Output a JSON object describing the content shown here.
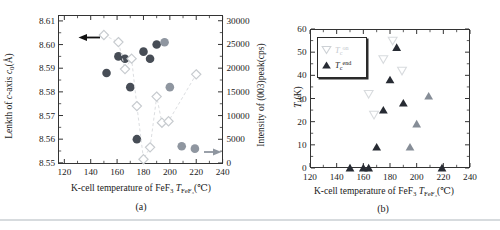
{
  "colors": {
    "axis": "#333333",
    "dark_marker": "#474d56",
    "gray_marker": "#8f96a0",
    "diamond_stroke": "#c7cbcf",
    "dash_line": "#dcdee1",
    "dark_triangle": "#272b33",
    "gray_triangle": "#868d97",
    "faint_stroke": "#d8dbde",
    "legend_on_text": "#c3c8cd",
    "text": "#1a1a1a"
  },
  "figure": {
    "panel_a": {
      "caption": "(a)",
      "ylabel_left_rich": [
        {
          "t": "Lenkth of "
        },
        {
          "t": "c",
          "i": 1
        },
        {
          "t": "-axis "
        },
        {
          "t": "c",
          "i": 1
        },
        {
          "t": "0",
          "sub": 1
        },
        {
          "t": "(Å)"
        }
      ],
      "ylabel_right": "Intensity of (003)peak(cps)",
      "xlabel_rich": [
        {
          "t": "K-cell temperature of FeF"
        },
        {
          "t": "3",
          "sub": 1
        },
        {
          "t": " "
        },
        {
          "t": "T",
          "i": 1
        },
        {
          "t": "FeF₃",
          "sub": 1
        },
        {
          "t": "(℃)"
        }
      ]
    },
    "panel_b": {
      "caption": "(b)",
      "ylabel_rich": [
        {
          "t": "T",
          "i": 1
        },
        {
          "t": "c",
          "sub": 1
        },
        {
          "t": "(K)"
        }
      ],
      "xlabel_rich": [
        {
          "t": "K-cell temperature of FeF"
        },
        {
          "t": "3",
          "sub": 1
        },
        {
          "t": " "
        },
        {
          "t": "T",
          "i": 1
        },
        {
          "t": "FeF₃",
          "sub": 1
        },
        {
          "t": "(℃)"
        }
      ],
      "legend": {
        "on_rich": [
          {
            "t": "T",
            "i": 1
          },
          {
            "t": "c",
            "sub": 1
          },
          {
            "t": "on",
            "sup": 1
          }
        ],
        "end_rich": [
          {
            "t": "T",
            "i": 1
          },
          {
            "t": "c",
            "sub": 1
          },
          {
            "t": "end",
            "sup": 1
          }
        ]
      }
    }
  },
  "chart_data": [
    {
      "panel": "a",
      "type": "scatter",
      "title": "",
      "xlabel": "K-cell temperature of FeF3 T_FeF3 (C)",
      "ylabel_left_text": "Lenkth of c-axis c0 (Angstrom)",
      "ylabel_right_text": "Intensity of (003)peak(cps)",
      "x_axis": {
        "min": 115.2,
        "max": 240.3,
        "ticks": [
          120,
          140,
          160,
          180,
          200,
          220,
          240
        ],
        "minor_step": 10
      },
      "y_left": {
        "min": 8.5495,
        "max": 8.6125,
        "ticks": [
          8.55,
          8.56,
          8.57,
          8.58,
          8.59,
          8.6,
          8.61
        ],
        "minor_step": 0.005,
        "decimals": 2
      },
      "y_right": {
        "min": -210,
        "max": 31210,
        "ticks": [
          0,
          5000,
          10000,
          15000,
          20000,
          25000,
          30000
        ],
        "minor_step": 2500
      },
      "series": [
        {
          "name": "c-axis length c0",
          "marker": "circle",
          "axis": "left",
          "points": [
            [
              152,
              8.588,
              "dark"
            ],
            [
              161,
              8.595,
              "dark"
            ],
            [
              166,
              8.594,
              "dark"
            ],
            [
              170,
              8.582,
              "dark"
            ],
            [
              175,
              8.56,
              "dark"
            ],
            [
              180,
              8.597,
              "dark"
            ],
            [
              185,
              8.594,
              "dark"
            ],
            [
              190,
              8.6,
              "dark"
            ],
            [
              196,
              8.601,
              "gray"
            ],
            [
              200,
              8.582,
              "gray"
            ],
            [
              209,
              8.557,
              "gray"
            ],
            [
              219,
              8.556,
              "gray"
            ]
          ]
        },
        {
          "name": "(003) peak intensity",
          "marker": "diamond-open",
          "axis": "right",
          "line": "dashed",
          "points": [
            [
              150,
              27000
            ],
            [
              161,
              25500
            ],
            [
              166,
              19800
            ],
            [
              171,
              22000
            ],
            [
              175,
              12000
            ],
            [
              180,
              800
            ],
            [
              185,
              3300
            ],
            [
              190,
              14000
            ],
            [
              194,
              8500
            ],
            [
              199,
              8800
            ],
            [
              220,
              18700
            ]
          ]
        }
      ]
    },
    {
      "panel": "b",
      "type": "scatter",
      "title": "",
      "xlabel": "K-cell temperature of FeF3 T_FeF3 (C)",
      "ylabel_text": "Tc (K)",
      "x_axis": {
        "min": 120,
        "max": 240,
        "ticks": [
          120,
          140,
          160,
          180,
          200,
          220,
          240
        ],
        "minor_step": 10
      },
      "y_axis": {
        "min": 0,
        "max": 60,
        "ticks": [
          0,
          10,
          20,
          30,
          40,
          50,
          60
        ],
        "minor_step": 5
      },
      "series": [
        {
          "name": "Tc onset",
          "marker": "triangle-down-open",
          "points": [
            [
              164,
              32
            ],
            [
              168,
              23
            ],
            [
              175,
              47
            ],
            [
              182,
              55
            ],
            [
              189,
              42
            ]
          ]
        },
        {
          "name": "Tc end",
          "marker": "triangle-up-filled",
          "points": [
            [
              150,
              0,
              "dark"
            ],
            [
              160,
              0,
              "dark"
            ],
            [
              164,
              0,
              "dark"
            ],
            [
              170,
              9,
              "dark"
            ],
            [
              175,
              25,
              "dark"
            ],
            [
              180,
              38,
              "dark"
            ],
            [
              185,
              52,
              "dark"
            ],
            [
              190,
              28,
              "dark"
            ],
            [
              195,
              9,
              "gray"
            ],
            [
              200,
              19,
              "gray"
            ],
            [
              209,
              31,
              "gray"
            ],
            [
              219,
              0,
              "dark"
            ]
          ]
        }
      ]
    }
  ]
}
